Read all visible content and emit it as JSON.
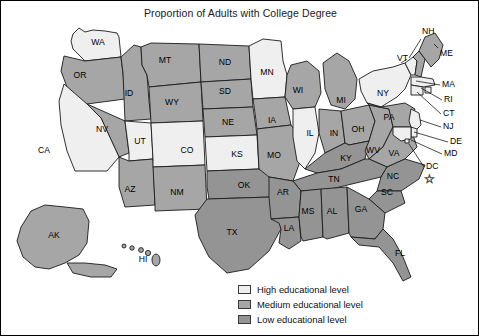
{
  "title": "Proportion of Adults with College Degree",
  "legend": {
    "items": [
      {
        "label": "High educational level",
        "level": "high",
        "color": "#efefef"
      },
      {
        "label": "Medium educational level",
        "level": "medium",
        "color": "#a6a6a6"
      },
      {
        "label": "Low educational level",
        "level": "low",
        "color": "#949494"
      }
    ]
  },
  "chart_data": {
    "type": "map",
    "title": "Proportion of Adults with College Degree",
    "xlabel": "",
    "ylabel": "",
    "grid": false,
    "legend_position": "bottom-center",
    "categories": [
      "High educational level",
      "Medium educational level",
      "Low educational level"
    ],
    "value_colors": {
      "high": "#efefef",
      "medium": "#a6a6a6",
      "low": "#949494"
    },
    "annotations": [
      "DC marked with a star symbol"
    ],
    "regions": [
      {
        "code": "WA",
        "level": "high"
      },
      {
        "code": "OR",
        "level": "medium"
      },
      {
        "code": "ID",
        "level": "medium"
      },
      {
        "code": "MT",
        "level": "medium"
      },
      {
        "code": "WY",
        "level": "medium"
      },
      {
        "code": "ND",
        "level": "medium"
      },
      {
        "code": "SD",
        "level": "medium"
      },
      {
        "code": "MN",
        "level": "high"
      },
      {
        "code": "WI",
        "level": "medium"
      },
      {
        "code": "MI",
        "level": "medium"
      },
      {
        "code": "CA",
        "level": "high"
      },
      {
        "code": "NV",
        "level": "medium"
      },
      {
        "code": "UT",
        "level": "high"
      },
      {
        "code": "CO",
        "level": "high"
      },
      {
        "code": "NE",
        "level": "medium"
      },
      {
        "code": "IA",
        "level": "medium"
      },
      {
        "code": "IL",
        "level": "high"
      },
      {
        "code": "IN",
        "level": "medium"
      },
      {
        "code": "OH",
        "level": "medium"
      },
      {
        "code": "AZ",
        "level": "medium"
      },
      {
        "code": "NM",
        "level": "medium"
      },
      {
        "code": "KS",
        "level": "high"
      },
      {
        "code": "MO",
        "level": "medium"
      },
      {
        "code": "KY",
        "level": "low"
      },
      {
        "code": "WV",
        "level": "medium"
      },
      {
        "code": "VA",
        "level": "medium"
      },
      {
        "code": "OK",
        "level": "low"
      },
      {
        "code": "AR",
        "level": "low"
      },
      {
        "code": "TN",
        "level": "low"
      },
      {
        "code": "NC",
        "level": "low"
      },
      {
        "code": "SC",
        "level": "low"
      },
      {
        "code": "TX",
        "level": "low"
      },
      {
        "code": "LA",
        "level": "low"
      },
      {
        "code": "MS",
        "level": "low"
      },
      {
        "code": "AL",
        "level": "low"
      },
      {
        "code": "GA",
        "level": "low"
      },
      {
        "code": "FL",
        "level": "low"
      },
      {
        "code": "NY",
        "level": "high"
      },
      {
        "code": "PA",
        "level": "medium"
      },
      {
        "code": "VT",
        "level": "high"
      },
      {
        "code": "NH",
        "level": "medium"
      },
      {
        "code": "ME",
        "level": "medium"
      },
      {
        "code": "MA",
        "level": "high"
      },
      {
        "code": "RI",
        "level": "high"
      },
      {
        "code": "CT",
        "level": "high"
      },
      {
        "code": "NJ",
        "level": "high"
      },
      {
        "code": "DE",
        "level": "high"
      },
      {
        "code": "MD",
        "level": "high"
      },
      {
        "code": "DC",
        "level": "high"
      },
      {
        "code": "AK",
        "level": "medium"
      },
      {
        "code": "HI",
        "level": "medium"
      }
    ]
  },
  "map_labels": {
    "inline": [
      {
        "code": "WA",
        "x": 97,
        "y": 42
      },
      {
        "code": "OR",
        "x": 79,
        "y": 75
      },
      {
        "code": "ID",
        "x": 128,
        "y": 93
      },
      {
        "code": "MT",
        "x": 164,
        "y": 60
      },
      {
        "code": "WY",
        "x": 171,
        "y": 102
      },
      {
        "code": "ND",
        "x": 224,
        "y": 62
      },
      {
        "code": "SD",
        "x": 224,
        "y": 91
      },
      {
        "code": "MN",
        "x": 266,
        "y": 72
      },
      {
        "code": "WI",
        "x": 297,
        "y": 90
      },
      {
        "code": "MI",
        "x": 340,
        "y": 100
      },
      {
        "code": "CA",
        "x": 43,
        "y": 150
      },
      {
        "code": "NV",
        "x": 101,
        "y": 129
      },
      {
        "code": "UT",
        "x": 139,
        "y": 141
      },
      {
        "code": "CO",
        "x": 186,
        "y": 150
      },
      {
        "code": "NE",
        "x": 227,
        "y": 122
      },
      {
        "code": "IA",
        "x": 271,
        "y": 120
      },
      {
        "code": "IL",
        "x": 309,
        "y": 133
      },
      {
        "code": "IN",
        "x": 333,
        "y": 133
      },
      {
        "code": "OH",
        "x": 357,
        "y": 129
      },
      {
        "code": "AZ",
        "x": 129,
        "y": 189
      },
      {
        "code": "NM",
        "x": 176,
        "y": 192
      },
      {
        "code": "KS",
        "x": 236,
        "y": 154
      },
      {
        "code": "MO",
        "x": 273,
        "y": 155
      },
      {
        "code": "KY",
        "x": 345,
        "y": 158
      },
      {
        "code": "WV",
        "x": 372,
        "y": 150
      },
      {
        "code": "VA",
        "x": 393,
        "y": 153
      },
      {
        "code": "OK",
        "x": 243,
        "y": 185
      },
      {
        "code": "AR",
        "x": 282,
        "y": 192
      },
      {
        "code": "TN",
        "x": 333,
        "y": 179
      },
      {
        "code": "NC",
        "x": 392,
        "y": 176
      },
      {
        "code": "SC",
        "x": 386,
        "y": 192
      },
      {
        "code": "TX",
        "x": 231,
        "y": 232
      },
      {
        "code": "LA",
        "x": 288,
        "y": 228
      },
      {
        "code": "MS",
        "x": 307,
        "y": 211
      },
      {
        "code": "AL",
        "x": 331,
        "y": 211
      },
      {
        "code": "GA",
        "x": 360,
        "y": 209
      },
      {
        "code": "FL",
        "x": 399,
        "y": 253
      },
      {
        "code": "NY",
        "x": 382,
        "y": 93
      },
      {
        "code": "PA",
        "x": 388,
        "y": 117
      },
      {
        "code": "AK",
        "x": 53,
        "y": 235
      },
      {
        "code": "HI",
        "x": 142,
        "y": 259
      }
    ],
    "callouts": [
      {
        "code": "NH",
        "tx": 421,
        "ty": 31,
        "ax": 420,
        "ay": 38,
        "bx": 408,
        "by": 57
      },
      {
        "code": "VT",
        "tx": 396,
        "ty": 58,
        "ax": 406,
        "ay": 58,
        "bx": 400,
        "by": 62
      },
      {
        "code": "ME",
        "tx": 439,
        "ty": 53,
        "ax": 437,
        "ay": 47,
        "bx": 433,
        "by": 43
      },
      {
        "code": "MA",
        "tx": 441,
        "ty": 84,
        "ax": 439,
        "ay": 84,
        "bx": 415,
        "by": 80
      },
      {
        "code": "RI",
        "tx": 443,
        "ty": 99,
        "ax": 441,
        "ay": 99,
        "bx": 420,
        "by": 87
      },
      {
        "code": "CT",
        "tx": 442,
        "ty": 113,
        "ax": 440,
        "ay": 113,
        "bx": 416,
        "by": 91
      },
      {
        "code": "NJ",
        "tx": 442,
        "ty": 126,
        "ax": 440,
        "ay": 126,
        "bx": 419,
        "by": 119
      },
      {
        "code": "DE",
        "tx": 449,
        "ty": 141,
        "ax": 447,
        "ay": 141,
        "bx": 413,
        "by": 131
      },
      {
        "code": "MD",
        "tx": 443,
        "ty": 153,
        "ax": 441,
        "ay": 153,
        "bx": 410,
        "by": 139
      },
      {
        "code": "DC",
        "tx": 425,
        "ty": 166,
        "ax": 423,
        "ay": 166,
        "bx": 408,
        "by": 143
      }
    ],
    "dc_star": {
      "x": 428,
      "y": 179
    }
  }
}
